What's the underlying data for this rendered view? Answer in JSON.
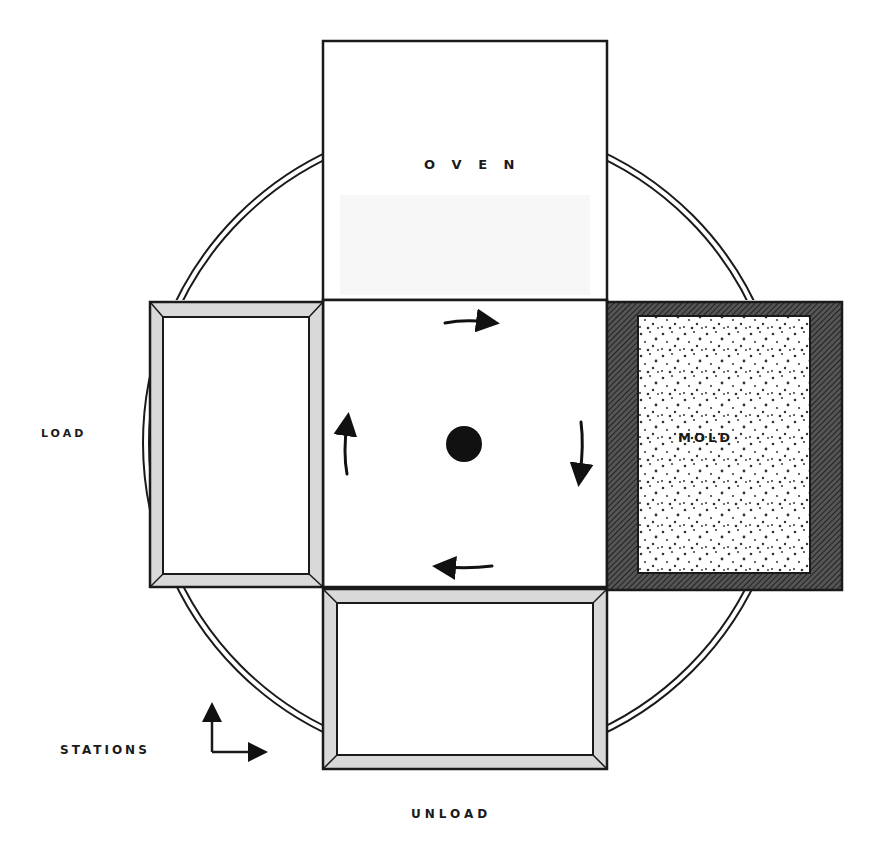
{
  "diagram": {
    "type": "rotational molding machine layout (top view)",
    "labels": {
      "oven": "O V E N",
      "mold": "MOLD",
      "load": "LOAD",
      "unload": "UNLOAD",
      "stations": "STATIONS"
    },
    "stations": [
      {
        "name": "OVEN",
        "position": "top"
      },
      {
        "name": "MOLD",
        "position": "right"
      },
      {
        "name": "UNLOAD",
        "position": "bottom"
      },
      {
        "name": "LOAD",
        "position": "left"
      }
    ],
    "rotation": "clockwise",
    "colors": {
      "line": "#1a1a1a",
      "frame_fill": "#d9d9d9",
      "hatch": "#3a3a3a",
      "background": "#ffffff"
    }
  }
}
